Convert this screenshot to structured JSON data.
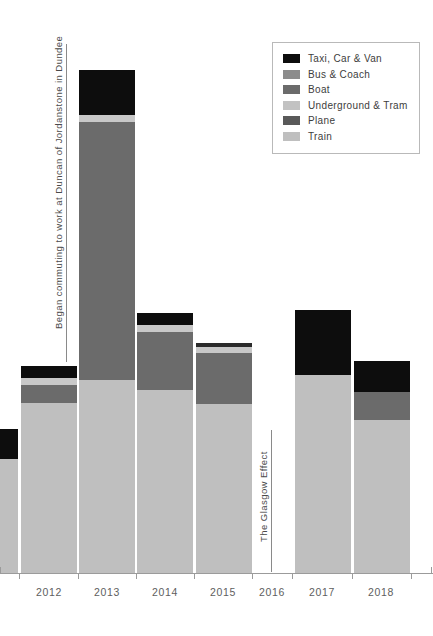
{
  "chart_data": {
    "type": "bar",
    "subtype": "stacked",
    "title": "",
    "subtitle": "",
    "xlabel": "",
    "ylabel": "",
    "grid": false,
    "legend_position": "top-right",
    "categories": [
      "2011",
      "2012",
      "2013",
      "2014",
      "2015",
      "2016",
      "2017",
      "2018"
    ],
    "tick_labels": [
      "2012",
      "2013",
      "2014",
      "2015",
      "2016",
      "2017",
      "2018"
    ],
    "series": [
      {
        "name": "Taxi, Car & Van",
        "color": "#0d0d0d",
        "values": [
          30,
          12,
          45,
          12,
          4,
          0,
          65,
          31
        ]
      },
      {
        "name": "Bus & Coach",
        "color": "#8c8c8c",
        "values": [
          0,
          0,
          0,
          0,
          0,
          0,
          0,
          0
        ]
      },
      {
        "name": "Boat",
        "color": "#6b6b6b",
        "values": [
          0,
          18,
          258,
          58,
          51,
          0,
          0,
          28
        ]
      },
      {
        "name": "Underground & Tram",
        "color": "#c2c2c2",
        "values": [
          0,
          7,
          7,
          7,
          6,
          0,
          0,
          0
        ]
      },
      {
        "name": "Plane",
        "color": "#595959",
        "values": [
          0,
          0,
          0,
          0,
          0,
          0,
          0,
          0
        ]
      },
      {
        "name": "Train",
        "color": "#bfbfbf",
        "values": [
          113,
          170,
          193,
          183,
          169,
          0,
          198,
          153
        ]
      }
    ],
    "annotations": [
      "Began commuting to work at Duncan of Jordanstone in Dundee",
      "The Glasgow Effect"
    ]
  },
  "legend": {
    "items": [
      {
        "label": "Taxi, Car & Van",
        "color": "#0d0d0d"
      },
      {
        "label": "Bus & Coach",
        "color": "#8c8c8c"
      },
      {
        "label": "Boat",
        "color": "#6b6b6b"
      },
      {
        "label": "Underground & Tram",
        "color": "#c2c2c2"
      },
      {
        "label": "Plane",
        "color": "#595959"
      },
      {
        "label": "Train",
        "color": "#bfbfbf"
      }
    ]
  },
  "axis": {
    "labels": [
      "2012",
      "2013",
      "2014",
      "2015",
      "2016",
      "2017",
      "2018"
    ]
  },
  "annotations": {
    "left": "Began commuting to work at Duncan of Jordanstone in Dundee",
    "right": "The Glasgow Effect"
  },
  "bars": [
    {
      "year": "2011",
      "x": -38,
      "width": 56,
      "segments": [
        {
          "name": "Taxi, Car & Van",
          "color": "#0d0d0d",
          "top": 429,
          "bottom": 459
        },
        {
          "name": "Train",
          "color": "#bfbfbf",
          "top": 459,
          "bottom": 573
        }
      ]
    },
    {
      "year": "2012",
      "x": 21,
      "width": 56,
      "segments": [
        {
          "name": "Taxi, Car & Van",
          "color": "#0d0d0d",
          "top": 366,
          "bottom": 378
        },
        {
          "name": "Underground & Tram",
          "color": "#c8c8c8",
          "top": 378,
          "bottom": 385
        },
        {
          "name": "Boat",
          "color": "#6b6b6b",
          "top": 385,
          "bottom": 403
        },
        {
          "name": "Train",
          "color": "#bfbfbf",
          "top": 403,
          "bottom": 573
        }
      ]
    },
    {
      "year": "2013",
      "x": 79,
      "width": 56,
      "segments": [
        {
          "name": "Taxi, Car & Van",
          "color": "#0d0d0d",
          "top": 70,
          "bottom": 115
        },
        {
          "name": "Underground & Tram",
          "color": "#c8c8c8",
          "top": 115,
          "bottom": 122
        },
        {
          "name": "Boat",
          "color": "#6b6b6b",
          "top": 122,
          "bottom": 380
        },
        {
          "name": "Train",
          "color": "#bfbfbf",
          "top": 380,
          "bottom": 573
        }
      ]
    },
    {
      "year": "2014",
      "x": 137,
      "width": 56,
      "segments": [
        {
          "name": "Taxi, Car & Van",
          "color": "#0d0d0d",
          "top": 313,
          "bottom": 325
        },
        {
          "name": "Underground & Tram",
          "color": "#c8c8c8",
          "top": 325,
          "bottom": 332
        },
        {
          "name": "Boat",
          "color": "#6b6b6b",
          "top": 332,
          "bottom": 390
        },
        {
          "name": "Train",
          "color": "#bfbfbf",
          "top": 390,
          "bottom": 573
        }
      ]
    },
    {
      "year": "2015",
      "x": 196,
      "width": 56,
      "segments": [
        {
          "name": "Taxi, Car & Van",
          "color": "#2b2b2b",
          "top": 343,
          "bottom": 347
        },
        {
          "name": "Underground & Tram",
          "color": "#c8c8c8",
          "top": 347,
          "bottom": 353
        },
        {
          "name": "Boat",
          "color": "#6b6b6b",
          "top": 353,
          "bottom": 404
        },
        {
          "name": "Train",
          "color": "#bfbfbf",
          "top": 404,
          "bottom": 573
        }
      ]
    },
    {
      "year": "2017",
      "x": 295,
      "width": 56,
      "segments": [
        {
          "name": "Taxi, Car & Van",
          "color": "#0d0d0d",
          "top": 310,
          "bottom": 375
        },
        {
          "name": "Train",
          "color": "#bfbfbf",
          "top": 375,
          "bottom": 573
        }
      ]
    },
    {
      "year": "2018",
      "x": 354,
      "width": 56,
      "segments": [
        {
          "name": "Taxi, Car & Van",
          "color": "#0d0d0d",
          "top": 361,
          "bottom": 392
        },
        {
          "name": "Boat",
          "color": "#6b6b6b",
          "top": 392,
          "bottom": 420
        },
        {
          "name": "Train",
          "color": "#bfbfbf",
          "top": 420,
          "bottom": 573
        }
      ]
    }
  ]
}
